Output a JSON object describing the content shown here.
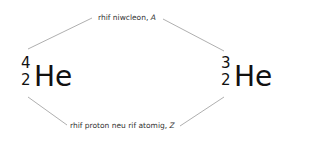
{
  "labels": {
    "mass_number": {
      "text": "rhif niwcleon, ",
      "symbol": "A"
    },
    "atomic_number": {
      "text": "rhif proton neu rif atomig, ",
      "symbol": "Z"
    }
  },
  "nuclides": [
    {
      "mass": "4",
      "atomic": "2",
      "symbol": "He"
    },
    {
      "mass": "3",
      "atomic": "2",
      "symbol": "He"
    }
  ],
  "colors": {
    "line": "#9a9a9a",
    "text": "#111111",
    "label": "#333333"
  }
}
